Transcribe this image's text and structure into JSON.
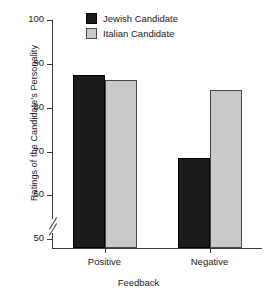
{
  "chart_data": {
    "type": "bar",
    "title": "",
    "xlabel": "Feedback",
    "ylabel": "Ratings of the Candidate's Personality",
    "categories": [
      "Positive",
      "Negative"
    ],
    "series": [
      {
        "name": "Jewish Candidate",
        "color": "#1c1c1c",
        "values": [
          87.5,
          68.6
        ]
      },
      {
        "name": "Italian Candidate",
        "color": "#c9c9c9",
        "values": [
          86.3,
          84.0
        ]
      }
    ],
    "ylim": [
      48,
      100
    ],
    "yticks": [
      50,
      60,
      70,
      80,
      90,
      100
    ],
    "ytick_labels": [
      "50",
      "60",
      "70",
      "80",
      "90",
      "100"
    ],
    "axis_break": true,
    "axis_break_note": "y-axis broken below 50",
    "grid": false,
    "legend_position": "top-center"
  },
  "legend": {
    "items": [
      {
        "label": "Jewish Candidate",
        "swatch": "dark"
      },
      {
        "label": "Italian Candidate",
        "swatch": "light"
      }
    ]
  },
  "axes": {
    "y_title": "Ratings of the Candidate's Personality",
    "x_title": "Feedback",
    "y_tick_labels": [
      "100",
      "90",
      "80",
      "70",
      "60",
      "50"
    ],
    "x_tick_labels": [
      "Positive",
      "Negative"
    ]
  }
}
